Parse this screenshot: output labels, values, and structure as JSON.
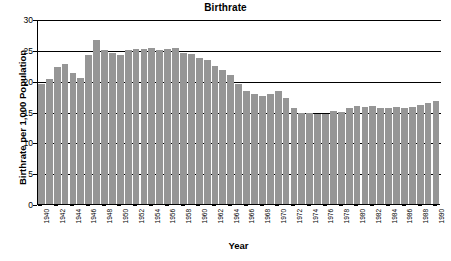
{
  "chart_data": {
    "type": "bar",
    "title": "Birthrate",
    "xlabel": "Year",
    "ylabel": "Birthrate per 1,000 Population",
    "ylim": [
      0,
      30
    ],
    "yticks": [
      0,
      5,
      10,
      15,
      20,
      25,
      30
    ],
    "grid": true,
    "legend": null,
    "bar_color": "#969696",
    "xtick_step": 2,
    "categories": [
      "1940",
      "1941",
      "1942",
      "1943",
      "1944",
      "1945",
      "1946",
      "1947",
      "1948",
      "1949",
      "1950",
      "1951",
      "1952",
      "1953",
      "1954",
      "1955",
      "1956",
      "1957",
      "1958",
      "1959",
      "1960",
      "1961",
      "1962",
      "1963",
      "1964",
      "1965",
      "1966",
      "1967",
      "1968",
      "1969",
      "1970",
      "1971",
      "1972",
      "1973",
      "1974",
      "1975",
      "1976",
      "1977",
      "1978",
      "1979",
      "1980",
      "1981",
      "1982",
      "1983",
      "1984",
      "1985",
      "1986",
      "1987",
      "1988",
      "1989",
      "1990"
    ],
    "values": [
      19.4,
      20.3,
      22.2,
      22.7,
      21.2,
      20.4,
      24.1,
      26.6,
      24.9,
      24.5,
      24.1,
      24.9,
      25.1,
      25.1,
      25.3,
      25.0,
      25.2,
      25.3,
      24.5,
      24.3,
      23.7,
      23.3,
      22.4,
      21.7,
      21.0,
      19.4,
      18.4,
      17.8,
      17.5,
      17.8,
      18.4,
      17.2,
      15.6,
      14.8,
      14.8,
      14.6,
      14.6,
      15.1,
      15.0,
      15.6,
      15.9,
      15.8,
      15.9,
      15.6,
      15.6,
      15.8,
      15.6,
      15.7,
      16.0,
      16.4,
      16.7
    ]
  }
}
